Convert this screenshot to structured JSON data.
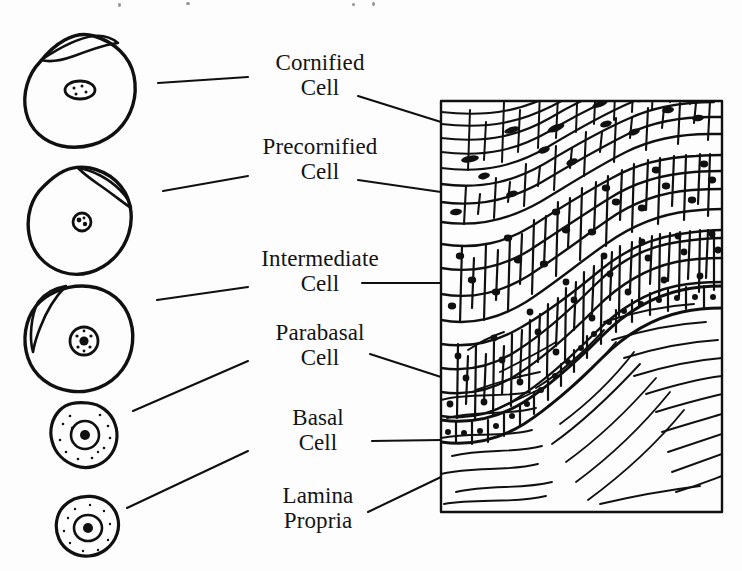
{
  "figure": {
    "background_color": "#fdfdfd",
    "ink_color": "#101010"
  },
  "labels": [
    {
      "id": "cornified",
      "line1": "Cornified",
      "line2": "Cell"
    },
    {
      "id": "precornified",
      "line1": "Precornified",
      "line2": "Cell"
    },
    {
      "id": "intermediate",
      "line1": "Intermediate",
      "line2": "Cell"
    },
    {
      "id": "parabasal",
      "line1": "Parabasal",
      "line2": "Cell"
    },
    {
      "id": "basal",
      "line1": "Basal",
      "line2": "Cell"
    },
    {
      "id": "lamina",
      "line1": "Lamina",
      "line2": "Propria"
    }
  ],
  "cell_diagrams": [
    {
      "id": "cornified-cell",
      "name": "Cornified cell drawing",
      "shape": "large irregular polygon with folded upper edge",
      "nucleus": "small flattened pyknotic nucleus with internal dots",
      "relative_size": "largest"
    },
    {
      "id": "precornified-cell",
      "name": "Precornified cell drawing",
      "shape": "large rounded irregular polygon with folded upper-right edge",
      "nucleus": "small dense dark nucleus",
      "relative_size": "large"
    },
    {
      "id": "intermediate-cell",
      "name": "Intermediate cell drawing",
      "shape": "rounded irregular polygon with folded left edge",
      "nucleus": "medium round nucleus with coarse chromatin",
      "relative_size": "large"
    },
    {
      "id": "parabasal-cell",
      "name": "Parabasal cell drawing",
      "shape": "small angular rounded cell with granular cytoplasm",
      "nucleus": "large round nucleus with dark central mass",
      "relative_size": "small"
    },
    {
      "id": "basal-cell",
      "name": "Basal cell drawing",
      "shape": "smallest oval cell with granular cytoplasm",
      "nucleus": "large round nucleus, high nuclear-to-cytoplasmic ratio",
      "relative_size": "smallest"
    }
  ],
  "tissue_panel": {
    "name": "Epithelium cross-section",
    "border": true,
    "layers": [
      {
        "id": "cornified-layer",
        "description": "flattened elongated squames at surface"
      },
      {
        "id": "precornified-layer",
        "description": "elongated cells with small dark nuclei"
      },
      {
        "id": "intermediate-layer",
        "description": "polygonal cells with round nuclei"
      },
      {
        "id": "parabasal-layer",
        "description": "small densely packed polygonal cells"
      },
      {
        "id": "basal-layer",
        "description": "single row of columnar basal cells"
      },
      {
        "id": "lamina-propria",
        "description": "wavy connective tissue fibers"
      }
    ]
  },
  "leader_lines": {
    "left": [
      {
        "from": "cornified-cell",
        "to": "cornified"
      },
      {
        "from": "precornified-cell",
        "to": "precornified"
      },
      {
        "from": "intermediate-cell",
        "to": "intermediate"
      },
      {
        "from": "parabasal-cell",
        "to": "parabasal"
      },
      {
        "from": "basal-cell",
        "to": "basal"
      }
    ],
    "right": [
      {
        "from": "cornified",
        "to": "cornified-layer"
      },
      {
        "from": "precornified",
        "to": "precornified-layer"
      },
      {
        "from": "intermediate",
        "to": "intermediate-layer"
      },
      {
        "from": "parabasal",
        "to": "parabasal-layer"
      },
      {
        "from": "basal",
        "to": "basal-layer"
      },
      {
        "from": "lamina",
        "to": "lamina-propria"
      }
    ]
  }
}
